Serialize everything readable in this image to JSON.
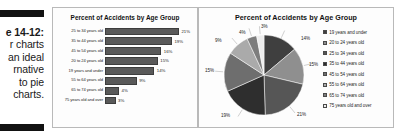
{
  "caption": {
    "figure_label": "e 14-12:",
    "lines": [
      "r charts",
      "an ideal",
      "rnative",
      "to pie",
      "charts."
    ]
  },
  "bar_panel": {
    "title": "Percent of Accidents by Age Group"
  },
  "pie_panel": {
    "title": "Percent of Accidents by Age Group"
  },
  "chart_data": [
    {
      "type": "bar",
      "orientation": "horizontal",
      "title": "Percent of Accidents by Age Group",
      "xlabel": "",
      "ylabel": "",
      "xlim": [
        0,
        25
      ],
      "grid": false,
      "categories": [
        "25 to 34 years old",
        "35 to 44 years old",
        "45 to 54 years old",
        "20 to 24 years old",
        "19 years and under",
        "55 to 64 years old",
        "65 to 74 years old",
        "75 years old and over"
      ],
      "values": [
        21,
        19,
        16,
        15,
        14,
        9,
        4,
        3
      ],
      "value_labels": [
        "21%",
        "19%",
        "16%",
        "15%",
        "14%",
        "9%",
        "4%",
        "3%"
      ],
      "bar_color": "#595959"
    },
    {
      "type": "pie",
      "title": "Percent of Accidents by Age Group",
      "legend_position": "right",
      "labels": [
        "19 years and under",
        "20 to 24 years old",
        "25 to 34 years old",
        "35 to 44 years old",
        "45 to 54 years old",
        "55 to 64 years old",
        "65 to 74 years old",
        "75 years old and over"
      ],
      "values": [
        14,
        15,
        21,
        19,
        16,
        9,
        4,
        3
      ],
      "value_labels": [
        "14%",
        "15%",
        "21%",
        "19%",
        "16%",
        "9%",
        "4%",
        "3%"
      ],
      "colors": [
        "#3f3f3f",
        "#8f8f8f",
        "#565656",
        "#2e2e2e",
        "#6e6e6e",
        "#aaaaaa",
        "#7d7d7d",
        "#ededed"
      ]
    }
  ],
  "pie_labels_positions": [
    {
      "text": "3%",
      "x": 56,
      "y": 0
    },
    {
      "text": "14%",
      "x": 96,
      "y": 12
    },
    {
      "text": "15%",
      "x": 104,
      "y": 38
    },
    {
      "text": "21%",
      "x": 92,
      "y": 88
    },
    {
      "text": "19%",
      "x": 16,
      "y": 89
    },
    {
      "text": "15%",
      "x": 0,
      "y": 44
    },
    {
      "text": "9%",
      "x": 10,
      "y": 14
    },
    {
      "text": "4%",
      "x": 34,
      "y": 6
    }
  ]
}
